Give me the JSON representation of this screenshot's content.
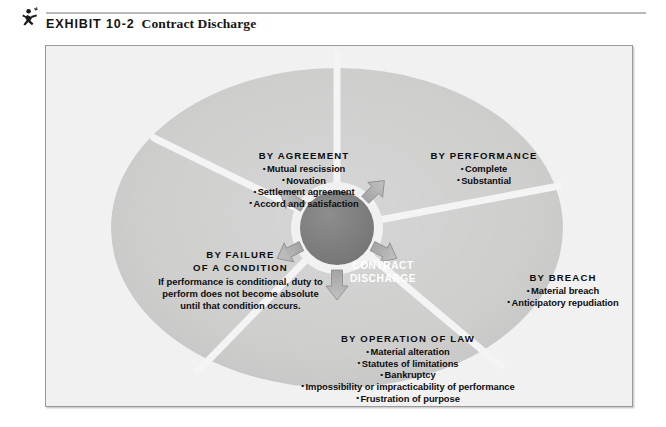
{
  "header": {
    "icon": "running-figure-icon",
    "exhibit_label": "EXHIBIT 10-2",
    "exhibit_title": "Contract Discharge"
  },
  "colors": {
    "page_background": "#ffffff",
    "frame_background": "#f1f1f1",
    "frame_border": "#9a9a9a",
    "wedge_fill": "#cfcfcf",
    "wedge_separator": "#f4f4f4",
    "hub_fill": "#808080",
    "hub_text": "#ffffff",
    "arrow_fill": "#b0b0b0",
    "arrow_stroke": "#8c8c8c",
    "body_text": "#0d0d0d"
  },
  "diagram": {
    "type": "radial-wedge-diagram",
    "hub": {
      "line1": "CONTRACT",
      "line2": "DISCHARGE"
    },
    "arrow_count": 5,
    "wedges": [
      {
        "id": "by-agreement",
        "title": "BY AGREEMENT",
        "position": "upper-left",
        "items": [
          "Mutual rescission",
          "Novation",
          "Settlement agreement",
          "Accord and satisfaction"
        ]
      },
      {
        "id": "by-performance",
        "title": "BY PERFORMANCE",
        "position": "upper-right",
        "items": [
          "Complete",
          "Substantial"
        ]
      },
      {
        "id": "by-breach",
        "title": "BY BREACH",
        "position": "right",
        "items": [
          "Material breach",
          "Anticipatory repudiation"
        ]
      },
      {
        "id": "by-operation-of-law",
        "title": "BY OPERATION OF LAW",
        "position": "bottom",
        "items": [
          "Material alteration",
          "Statutes of limitations",
          "Bankruptcy",
          "Impossibility or impracticability of performance",
          "Frustration of purpose"
        ]
      },
      {
        "id": "by-failure-of-a-condition",
        "title_line1": "BY FAILURE",
        "title_line2": "OF A CONDITION",
        "position": "left",
        "paragraph": "If performance is conditional, duty to perform does not become absolute until that condition occurs."
      }
    ]
  },
  "bullet": "•"
}
